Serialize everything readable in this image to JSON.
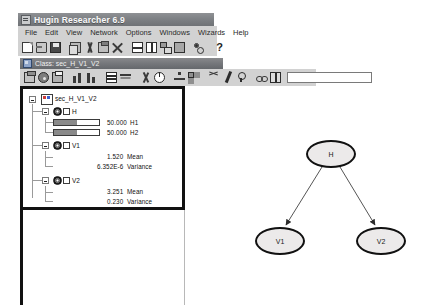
{
  "window": {
    "title": "Hugin Researcher 6.9",
    "icon": "app-icon"
  },
  "menubar": {
    "items": [
      {
        "label": "File"
      },
      {
        "label": "Edit"
      },
      {
        "label": "View"
      },
      {
        "label": "Network"
      },
      {
        "label": "Options"
      },
      {
        "label": "Windows"
      },
      {
        "label": "Wizards"
      },
      {
        "label": "Help"
      }
    ]
  },
  "toolbar_main": {
    "buttons": [
      {
        "icon": "new-document-icon",
        "label": "New"
      },
      {
        "icon": "open-folder-icon",
        "label": "Open"
      },
      {
        "icon": "save-disk-icon",
        "label": "Save"
      },
      {
        "icon": "copy-icon",
        "label": "Copy"
      },
      {
        "icon": "cut-scissors-icon",
        "label": "Cut"
      },
      {
        "icon": "paste-clipboard-icon",
        "label": "Paste"
      },
      {
        "icon": "delete-x-icon",
        "label": "Delete"
      },
      {
        "icon": "horizontal-split-icon",
        "label": "Horizontal Split"
      },
      {
        "icon": "vertical-split-icon",
        "label": "Vertical Split"
      },
      {
        "icon": "network-nodes-icon",
        "label": "Network View"
      },
      {
        "icon": "filled-panel-icon",
        "label": "Panel"
      },
      {
        "icon": "graph-structure-icon",
        "label": "Graph"
      },
      {
        "icon": "question-mark-icon",
        "label": "Help"
      }
    ],
    "help_glyph": "?"
  },
  "document_window": {
    "icon": "document-icon",
    "title": "Class: sec_H_V1_V2"
  },
  "toolbar_document": {
    "buttons": [
      {
        "icon": "open-class-icon",
        "label": "Open Class"
      },
      {
        "icon": "compile-disk-icon",
        "label": "Compile"
      },
      {
        "icon": "print-icon",
        "label": "Print"
      },
      {
        "icon": "bar-chart-up-icon",
        "label": "Bar Chart"
      },
      {
        "icon": "bar-chart-down-icon",
        "label": "Bar Chart 2"
      },
      {
        "icon": "table-icon",
        "label": "Table"
      },
      {
        "icon": "list-lines-icon",
        "label": "List"
      },
      {
        "icon": "scissors-icon",
        "label": "Cut"
      },
      {
        "icon": "run-propagate-icon",
        "label": "Propagate"
      },
      {
        "icon": "tree-icon",
        "label": "Junction Tree"
      },
      {
        "icon": "grid-icon",
        "label": "Grid"
      },
      {
        "icon": "y-branch-icon",
        "label": "Branch"
      },
      {
        "icon": "pen-icon",
        "label": "Edit Mode"
      },
      {
        "icon": "lightbulb-icon",
        "label": "Evidence"
      },
      {
        "icon": "link-icon",
        "label": "Link"
      },
      {
        "icon": "book-icon",
        "label": "Documentation"
      }
    ],
    "search_value": "",
    "search_placeholder": ""
  },
  "tree": {
    "root": {
      "label": "sec_H_V1_V2",
      "icon": "class-root-icon",
      "expanded": true
    },
    "nodes": [
      {
        "name": "H",
        "icon": "discrete-node-icon",
        "expanded": true,
        "type": "discrete",
        "states": [
          {
            "label": "H1",
            "value": "50.000",
            "percent": 50
          },
          {
            "label": "H2",
            "value": "50.000",
            "percent": 50
          }
        ]
      },
      {
        "name": "V1",
        "icon": "continuous-node-icon",
        "expanded": true,
        "type": "continuous",
        "stats": [
          {
            "value": "1.520",
            "label": "Mean"
          },
          {
            "value": "6.352E-6",
            "label": "Variance"
          }
        ]
      },
      {
        "name": "V2",
        "icon": "continuous-node-icon",
        "expanded": true,
        "type": "continuous",
        "stats": [
          {
            "value": "3.251",
            "label": "Mean"
          },
          {
            "value": "0.230",
            "label": "Variance"
          }
        ]
      }
    ]
  },
  "network": {
    "nodes": [
      {
        "id": "H",
        "label": "H",
        "cx": 146,
        "cy": 68,
        "rx": 25,
        "ry": 14
      },
      {
        "id": "V1",
        "label": "V1",
        "cx": 95,
        "cy": 155,
        "rx": 25,
        "ry": 14
      },
      {
        "id": "V2",
        "label": "V2",
        "cx": 196,
        "cy": 155,
        "rx": 25,
        "ry": 14
      }
    ],
    "edges": [
      {
        "from": "H",
        "to": "V1"
      },
      {
        "from": "H",
        "to": "V2"
      }
    ],
    "node_fill": "#eceaea",
    "node_stroke": "#111111"
  }
}
